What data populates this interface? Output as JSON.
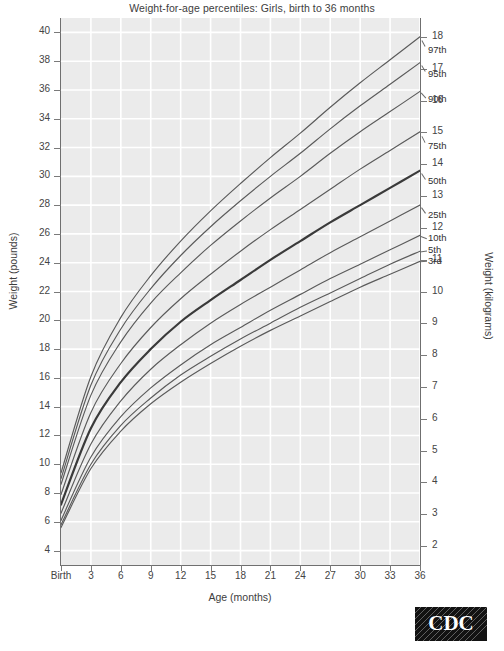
{
  "chart_data": {
    "type": "line",
    "title": "Weight-for-age percentiles: Girls, birth to 36 months",
    "xlabel": "Age (months)",
    "ylabel": "Weight (pounds)",
    "ylabel_right": "Weight (kilograms)",
    "xlim": [
      0,
      36
    ],
    "ylim": [
      3,
      41
    ],
    "ylim_right": [
      1.4,
      18.6
    ],
    "grid": true,
    "legend_position": "right-inline-labels",
    "x_tick_labels": [
      "Birth",
      "3",
      "6",
      "9",
      "12",
      "15",
      "18",
      "21",
      "24",
      "27",
      "30",
      "33",
      "36"
    ],
    "x_ticks": [
      0,
      3,
      6,
      9,
      12,
      15,
      18,
      21,
      24,
      27,
      30,
      33,
      36
    ],
    "y_ticks_pounds": [
      4,
      6,
      8,
      10,
      12,
      14,
      16,
      18,
      20,
      22,
      24,
      26,
      28,
      30,
      32,
      34,
      36,
      38,
      40
    ],
    "y_ticks_kilograms": [
      2,
      3,
      4,
      5,
      6,
      7,
      8,
      9,
      10,
      11,
      12,
      13,
      14,
      15,
      16,
      17,
      18
    ],
    "x": [
      0,
      3,
      6,
      9,
      12,
      15,
      18,
      21,
      24,
      27,
      30,
      33,
      36
    ],
    "series": [
      {
        "name": "97th",
        "label": "97th",
        "emphasis": false,
        "values": [
          9.4,
          16.1,
          20.2,
          23.1,
          25.5,
          27.6,
          29.5,
          31.3,
          33.0,
          34.8,
          36.5,
          38.1,
          39.7
        ]
      },
      {
        "name": "95th",
        "label": "95th",
        "emphasis": false,
        "values": [
          9.0,
          15.5,
          19.4,
          22.2,
          24.5,
          26.5,
          28.3,
          30.0,
          31.6,
          33.3,
          34.9,
          36.4,
          37.9
        ]
      },
      {
        "name": "90th",
        "label": "90th",
        "emphasis": false,
        "values": [
          8.6,
          14.8,
          18.5,
          21.2,
          23.3,
          25.2,
          26.9,
          28.5,
          30.0,
          31.6,
          33.1,
          34.5,
          35.9
        ]
      },
      {
        "name": "75th",
        "label": "75th",
        "emphasis": false,
        "values": [
          7.9,
          13.6,
          17.0,
          19.5,
          21.5,
          23.2,
          24.8,
          26.3,
          27.7,
          29.1,
          30.5,
          31.8,
          33.1
        ]
      },
      {
        "name": "50th",
        "label": "50th",
        "emphasis": true,
        "values": [
          7.2,
          12.5,
          15.7,
          18.0,
          19.9,
          21.4,
          22.8,
          24.2,
          25.5,
          26.8,
          28.0,
          29.2,
          30.4
        ]
      },
      {
        "name": "25th",
        "label": "25th",
        "emphasis": false,
        "values": [
          6.6,
          11.4,
          14.4,
          16.6,
          18.3,
          19.8,
          21.1,
          22.3,
          23.5,
          24.7,
          25.8,
          26.9,
          28.0
        ]
      },
      {
        "name": "10th",
        "label": "10th",
        "emphasis": false,
        "values": [
          6.1,
          10.5,
          13.3,
          15.3,
          16.9,
          18.3,
          19.5,
          20.7,
          21.8,
          22.9,
          23.9,
          24.9,
          25.9
        ]
      },
      {
        "name": "5th",
        "label": "5th",
        "emphasis": false,
        "values": [
          5.8,
          10.0,
          12.7,
          14.6,
          16.2,
          17.5,
          18.7,
          19.8,
          20.9,
          21.9,
          22.9,
          23.9,
          24.8
        ]
      },
      {
        "name": "3rd",
        "label": "3rd",
        "emphasis": false,
        "values": [
          5.6,
          9.7,
          12.3,
          14.2,
          15.7,
          17.0,
          18.2,
          19.3,
          20.3,
          21.3,
          22.3,
          23.2,
          24.1
        ]
      }
    ]
  },
  "style": {
    "plot_background": "#ebebeb",
    "gridline_color": "#ffffff",
    "curve_color": "#5a5a5a",
    "curve_color_median": "#3a3a3a",
    "axis_color": "#6f6f6f",
    "text_color": "#3d3d3d"
  },
  "footer": {
    "logo_text": "CDC"
  }
}
